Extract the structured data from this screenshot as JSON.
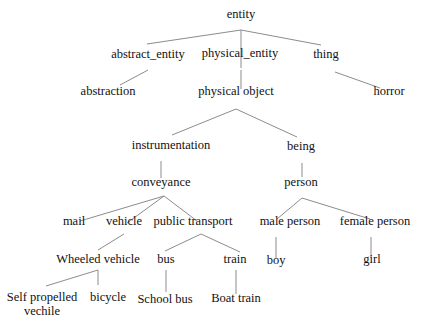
{
  "diagram": {
    "type": "tree",
    "edge_color": "#8c8c8c",
    "text_color": "#111111",
    "nodes": [
      {
        "id": "entity",
        "label": "entity"
      },
      {
        "id": "abstract_entity",
        "label": "abstract_entity",
        "parent": "entity"
      },
      {
        "id": "physical_entity",
        "label": "physical_entity",
        "parent": "entity"
      },
      {
        "id": "thing",
        "label": "thing",
        "parent": "entity"
      },
      {
        "id": "abstraction",
        "label": "abstraction",
        "parent": "abstract_entity"
      },
      {
        "id": "physical_object",
        "label": "physical object",
        "parent": "physical_entity"
      },
      {
        "id": "horror",
        "label": "horror",
        "parent": "thing"
      },
      {
        "id": "instrumentation",
        "label": "instrumentation",
        "parent": "physical_object"
      },
      {
        "id": "being",
        "label": "being",
        "parent": "physical_object"
      },
      {
        "id": "conveyance",
        "label": "conveyance",
        "parent": "instrumentation"
      },
      {
        "id": "person",
        "label": "person",
        "parent": "being"
      },
      {
        "id": "mail",
        "label": "mail",
        "parent": "conveyance"
      },
      {
        "id": "vehicle",
        "label": "vehicle",
        "parent": "conveyance"
      },
      {
        "id": "public_transport",
        "label": "public transport",
        "parent": "conveyance"
      },
      {
        "id": "male_person",
        "label": "male person",
        "parent": "person"
      },
      {
        "id": "female_person",
        "label": "female person",
        "parent": "person"
      },
      {
        "id": "wheeled_vehicle",
        "label": "Wheeled vehicle",
        "parent": "vehicle"
      },
      {
        "id": "bus",
        "label": "bus",
        "parent": "public_transport"
      },
      {
        "id": "train",
        "label": "train",
        "parent": "public_transport"
      },
      {
        "id": "boy",
        "label": "boy",
        "parent": "male_person"
      },
      {
        "id": "girl",
        "label": "girl",
        "parent": "female_person"
      },
      {
        "id": "self_propelled_vehicle",
        "label": "Self propelled\nvechile",
        "parent": "wheeled_vehicle"
      },
      {
        "id": "bicycle",
        "label": "bicycle",
        "parent": "wheeled_vehicle"
      },
      {
        "id": "school_bus",
        "label": "School bus",
        "parent": "bus"
      },
      {
        "id": "boat_train",
        "label": "Boat train",
        "parent": "train"
      }
    ]
  }
}
